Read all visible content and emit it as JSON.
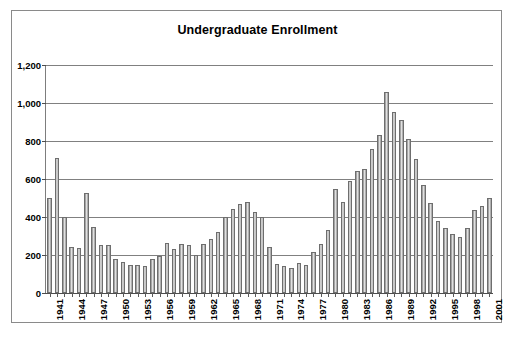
{
  "chart_data": {
    "type": "bar",
    "title": "Undergraduate Enrollment",
    "xlabel": "",
    "ylabel": "",
    "ylim": [
      0,
      1200
    ],
    "ytick_step": 200,
    "yticks": [
      "0",
      "200",
      "400",
      "600",
      "800",
      "1,000",
      "1,200"
    ],
    "grid": true,
    "legend": false,
    "legend_position": "none",
    "xtick_labels": [
      "1941",
      "1944",
      "1947",
      "1950",
      "1953",
      "1956",
      "1959",
      "1962",
      "1965",
      "1968",
      "1971",
      "1974",
      "1977",
      "1980",
      "1983",
      "1986",
      "1989",
      "1992",
      "1995",
      "1998",
      "2001"
    ],
    "xtick_label_step": 3,
    "categories": [
      "1941",
      "1942",
      "1943",
      "1944",
      "1945",
      "1946",
      "1947",
      "1948",
      "1949",
      "1950",
      "1951",
      "1952",
      "1953",
      "1954",
      "1955",
      "1956",
      "1957",
      "1958",
      "1959",
      "1960",
      "1961",
      "1962",
      "1963",
      "1964",
      "1965",
      "1966",
      "1967",
      "1968",
      "1969",
      "1970",
      "1971",
      "1972",
      "1973",
      "1974",
      "1975",
      "1976",
      "1977",
      "1978",
      "1979",
      "1980",
      "1981",
      "1982",
      "1983",
      "1984",
      "1985",
      "1986",
      "1987",
      "1988",
      "1989",
      "1990",
      "1991",
      "1992",
      "1993",
      "1994",
      "1995",
      "1996",
      "1997",
      "1998",
      "1999",
      "2000",
      "2001"
    ],
    "values": [
      500,
      710,
      400,
      240,
      235,
      525,
      350,
      255,
      255,
      180,
      165,
      145,
      150,
      140,
      180,
      195,
      265,
      230,
      260,
      255,
      200,
      260,
      285,
      320,
      400,
      440,
      470,
      480,
      425,
      400,
      240,
      155,
      140,
      130,
      160,
      145,
      215,
      260,
      330,
      545,
      480,
      590,
      640,
      655,
      760,
      830,
      1060,
      955,
      910,
      810,
      705,
      570,
      475,
      380,
      340,
      310,
      295,
      340,
      435,
      460,
      500
    ]
  },
  "colors": {
    "bar_fill_light": "#e2e2e2",
    "bar_fill_dark": "#8f8f8f",
    "bar_border": "#6e6e6e",
    "gridline": "#808080",
    "axis": "#4d4d4d",
    "frame": "#8a8a8a",
    "text": "#000000",
    "background": "#ffffff"
  }
}
